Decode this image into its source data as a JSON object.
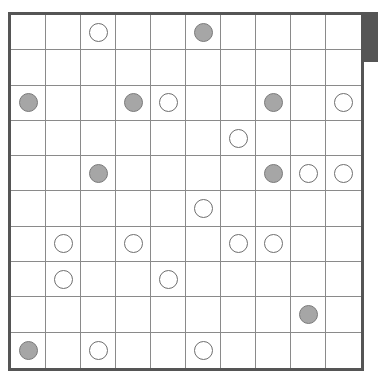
{
  "puzzle": {
    "type": "masyu",
    "rows": 10,
    "cols": 10,
    "colors": {
      "border": "#555555",
      "grid_line": "#8a8a8a",
      "white_pearl_fill": "#ffffff",
      "black_pearl_fill": "#a6a6a6",
      "side_tab": "#555555"
    },
    "pearls": [
      {
        "row": 0,
        "col": 2,
        "kind": "white"
      },
      {
        "row": 0,
        "col": 5,
        "kind": "black"
      },
      {
        "row": 2,
        "col": 0,
        "kind": "black"
      },
      {
        "row": 2,
        "col": 3,
        "kind": "black"
      },
      {
        "row": 2,
        "col": 4,
        "kind": "white"
      },
      {
        "row": 2,
        "col": 7,
        "kind": "black"
      },
      {
        "row": 2,
        "col": 9,
        "kind": "white"
      },
      {
        "row": 3,
        "col": 6,
        "kind": "white"
      },
      {
        "row": 4,
        "col": 2,
        "kind": "black"
      },
      {
        "row": 4,
        "col": 7,
        "kind": "black"
      },
      {
        "row": 4,
        "col": 8,
        "kind": "white"
      },
      {
        "row": 4,
        "col": 9,
        "kind": "white"
      },
      {
        "row": 5,
        "col": 5,
        "kind": "white"
      },
      {
        "row": 6,
        "col": 1,
        "kind": "white"
      },
      {
        "row": 6,
        "col": 3,
        "kind": "white"
      },
      {
        "row": 6,
        "col": 6,
        "kind": "white"
      },
      {
        "row": 6,
        "col": 7,
        "kind": "white"
      },
      {
        "row": 7,
        "col": 1,
        "kind": "white"
      },
      {
        "row": 7,
        "col": 4,
        "kind": "white"
      },
      {
        "row": 8,
        "col": 8,
        "kind": "black"
      },
      {
        "row": 9,
        "col": 0,
        "kind": "black"
      },
      {
        "row": 9,
        "col": 2,
        "kind": "white"
      },
      {
        "row": 9,
        "col": 5,
        "kind": "white"
      }
    ]
  }
}
